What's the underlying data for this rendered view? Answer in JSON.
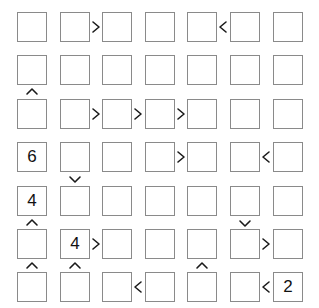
{
  "puzzle": {
    "type": "futoshiki",
    "size": 7,
    "grid": [
      [
        "",
        "",
        "",
        "",
        "",
        "",
        ""
      ],
      [
        "",
        "",
        "",
        "",
        "",
        "",
        ""
      ],
      [
        "",
        "",
        "",
        "",
        "",
        "",
        ""
      ],
      [
        "6",
        "",
        "",
        "",
        "",
        "",
        ""
      ],
      [
        "4",
        "",
        "",
        "",
        "",
        "",
        ""
      ],
      [
        "",
        "4",
        "",
        "",
        "",
        "",
        ""
      ],
      [
        "",
        "",
        "",
        "",
        "",
        "",
        "2"
      ]
    ],
    "horizontal_signs": [
      {
        "row": 0,
        "col": 1,
        "sign": ">"
      },
      {
        "row": 0,
        "col": 4,
        "sign": "<"
      },
      {
        "row": 2,
        "col": 1,
        "sign": ">"
      },
      {
        "row": 2,
        "col": 2,
        "sign": ">"
      },
      {
        "row": 2,
        "col": 3,
        "sign": ">"
      },
      {
        "row": 3,
        "col": 3,
        "sign": ">"
      },
      {
        "row": 3,
        "col": 5,
        "sign": "<"
      },
      {
        "row": 5,
        "col": 1,
        "sign": ">"
      },
      {
        "row": 5,
        "col": 5,
        "sign": ">"
      },
      {
        "row": 6,
        "col": 2,
        "sign": "<"
      },
      {
        "row": 6,
        "col": 5,
        "sign": "<"
      }
    ],
    "vertical_signs": [
      {
        "row": 1,
        "col": 0,
        "sign": "^"
      },
      {
        "row": 3,
        "col": 1,
        "sign": "v"
      },
      {
        "row": 4,
        "col": 0,
        "sign": "^"
      },
      {
        "row": 4,
        "col": 5,
        "sign": "v"
      },
      {
        "row": 5,
        "col": 0,
        "sign": "^"
      },
      {
        "row": 5,
        "col": 1,
        "sign": "^"
      },
      {
        "row": 5,
        "col": 4,
        "sign": "^"
      }
    ]
  },
  "layout": {
    "origin_x": 17,
    "origin_y": 12,
    "pitch_x": 42.6,
    "pitch_y": 43.4,
    "cell_size": 30
  },
  "colors": {
    "cell_border": "#8a8a8a",
    "digit": "#111111",
    "sign": "#1a1a1a",
    "background": "#ffffff"
  }
}
